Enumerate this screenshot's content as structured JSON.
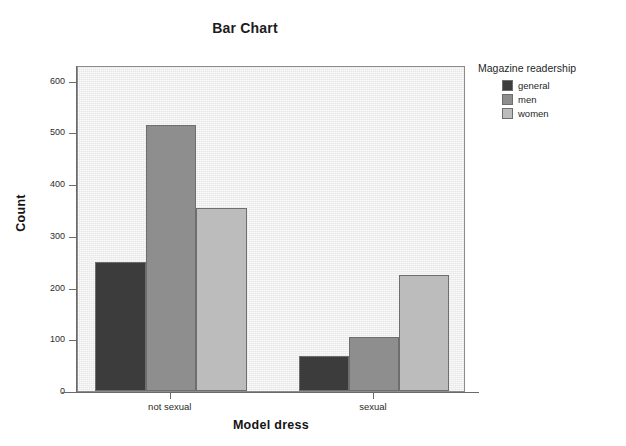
{
  "chart_data": {
    "type": "bar",
    "title": "Bar Chart",
    "xlabel": "Model dress",
    "ylabel": "Count",
    "categories": [
      "not sexual",
      "sexual"
    ],
    "series": [
      {
        "name": "general",
        "values": [
          249,
          68
        ],
        "color": "#3c3c3c"
      },
      {
        "name": "men",
        "values": [
          515,
          105
        ],
        "color": "#8e8e8e"
      },
      {
        "name": "women",
        "values": [
          353,
          225
        ],
        "color": "#bcbcbc"
      }
    ],
    "ylim": [
      0,
      630
    ],
    "yticks": [
      0,
      100,
      200,
      300,
      400,
      500,
      600
    ],
    "ytick_labels": [
      "0",
      "100",
      "200",
      "300",
      "400",
      "500",
      "600"
    ],
    "grid": false,
    "legend": {
      "title": "Magazine readership",
      "position": "right"
    },
    "plot_background": "#ededed",
    "frame_color": "#8c8c8c"
  }
}
